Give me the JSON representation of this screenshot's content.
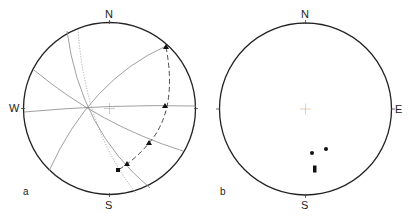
{
  "panels": [
    {
      "id": "a",
      "label": "a",
      "compass": {
        "north": "N",
        "south": "S",
        "west": "W"
      },
      "great_circles": [
        "solid arc NE",
        "solid E-W arc",
        "solid NW-SE arc",
        "solid N-S arc",
        "dotted N-S arc"
      ],
      "dashed_arc_markers": {
        "triangles": 4,
        "squares": 1
      }
    },
    {
      "id": "b",
      "label": "b",
      "compass": {
        "north": "N",
        "south": "S",
        "east": "E"
      },
      "points": 4
    }
  ]
}
